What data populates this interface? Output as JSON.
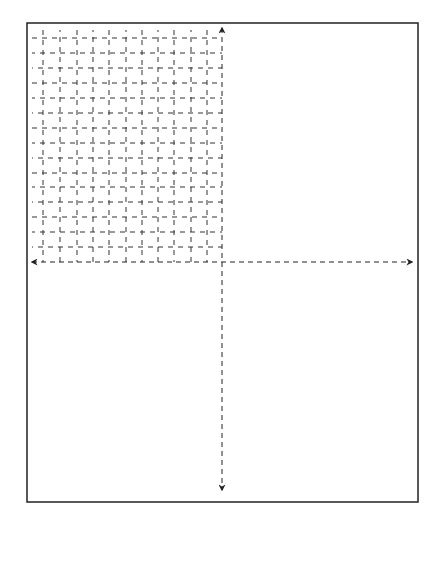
{
  "diagram": {
    "type": "dashed-grid-with-axes",
    "frame": {
      "x": 27,
      "y": 23,
      "width": 391,
      "height": 479,
      "stroke": "#222222"
    },
    "axes": {
      "origin": {
        "x": 222,
        "y": 262
      },
      "vertical": {
        "top": 28,
        "bottom": 490,
        "arrow_up": true,
        "arrow_down": true
      },
      "horizontal": {
        "left": 32,
        "right": 412,
        "arrow_left": true,
        "arrow_right": true
      }
    },
    "grid": {
      "quadrant": "upper-left",
      "x_left": 29,
      "x_right": 222,
      "y_top": 28,
      "y_bottom": 262,
      "vertical_lines_x": [
        43,
        60,
        77,
        93,
        109,
        126,
        142,
        158,
        174,
        191,
        207
      ],
      "horizontal_lines_y": [
        38,
        53,
        68,
        83,
        98,
        113,
        128,
        143,
        158,
        173,
        187,
        202,
        217,
        232,
        247
      ],
      "dash": "5 5",
      "color": "#333333"
    }
  }
}
